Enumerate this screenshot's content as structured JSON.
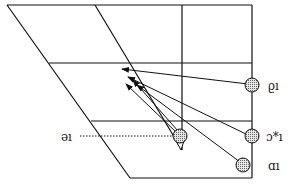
{
  "diagram": {
    "orientation": "rotated-180",
    "labels": {
      "ib": "ϱı",
      "ic_star": "ɔ*ı",
      "ia": "ɑı",
      "ie": "ǝı"
    },
    "nodes": [
      {
        "id": "ib",
        "label_key": "ib"
      },
      {
        "id": "ic_star",
        "label_key": "ic_star"
      },
      {
        "id": "ia",
        "label_key": "ia"
      },
      {
        "id": "ie",
        "label_key": "ie"
      }
    ],
    "colors": {
      "line": "#111111",
      "node_fill": "#bdbdbd",
      "background": "#ffffff"
    }
  }
}
